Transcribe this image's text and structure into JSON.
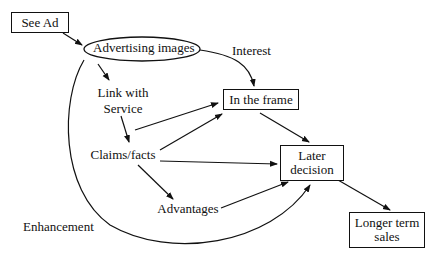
{
  "diagram": {
    "nodes": {
      "see_ad": "See Ad",
      "advertising_images": "Advertising images",
      "link_with_service_1": "Link with",
      "link_with_service_2": "Service",
      "in_the_frame": "In the frame",
      "claims_facts": "Claims/facts",
      "later_decision_1": "Later",
      "later_decision_2": "decision",
      "advantages": "Advantages",
      "longer_term_sales_1": "Longer term",
      "longer_term_sales_2": "sales"
    },
    "edge_labels": {
      "interest": "Interest",
      "enhancement": "Enhancement"
    },
    "edges": [
      {
        "from": "See Ad",
        "to": "Advertising images"
      },
      {
        "from": "Advertising images",
        "to": "Link with Service"
      },
      {
        "from": "Advertising images",
        "to": "In the frame",
        "label": "Interest"
      },
      {
        "from": "Link with Service",
        "to": "In the frame"
      },
      {
        "from": "Link with Service",
        "to": "Claims/facts"
      },
      {
        "from": "Claims/facts",
        "to": "In the frame"
      },
      {
        "from": "Claims/facts",
        "to": "Later decision"
      },
      {
        "from": "Claims/facts",
        "to": "Advantages"
      },
      {
        "from": "Advantages",
        "to": "Later decision"
      },
      {
        "from": "In the frame",
        "to": "Later decision"
      },
      {
        "from": "Advertising images",
        "to": "Later decision",
        "label": "Enhancement"
      },
      {
        "from": "Later decision",
        "to": "Longer term sales"
      }
    ]
  }
}
